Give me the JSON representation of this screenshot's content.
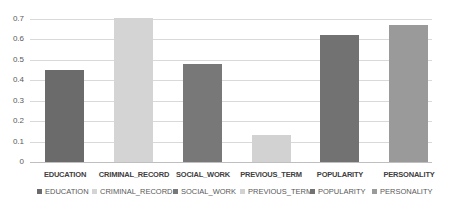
{
  "chart_data": {
    "type": "bar",
    "title": "",
    "xlabel": "",
    "ylabel": "",
    "ylim": [
      0,
      0.7
    ],
    "yticks": [
      "0",
      "0.1",
      "0.2",
      "0.3",
      "0.4",
      "0.5",
      "0.6",
      "0.7"
    ],
    "grid": true,
    "legend_position": "bottom",
    "categories": [
      "EDUCATION",
      "CRIMINAL_RECORD",
      "SOCIAL_WORK",
      "PREVIOUS_TERM",
      "POPULARITY",
      "PERSONALITY"
    ],
    "values": [
      0.45,
      0.7,
      0.48,
      0.13,
      0.62,
      0.67
    ],
    "colors": [
      "#6b6b6b",
      "#d4d4d4",
      "#787878",
      "#d2d2d2",
      "#727272",
      "#9a9a9a"
    ],
    "legend": [
      "EDUCATION",
      "CRIMINAL_RECORD",
      "SOCIAL_WORK",
      "PREVIOUS_TERM",
      "POPULARITY",
      "PERSONALITY"
    ]
  }
}
